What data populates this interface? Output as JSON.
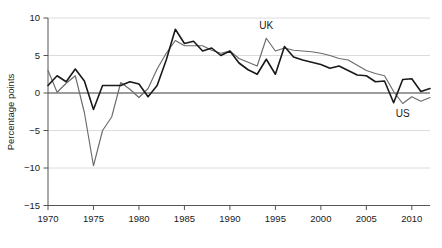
{
  "chart_data": {
    "type": "line",
    "title": "",
    "xlabel": "",
    "ylabel": "Percentage points",
    "xlim": [
      1970,
      2012
    ],
    "ylim": [
      -15,
      10
    ],
    "grid": true,
    "grid_axis": "y",
    "legend_position": "inline-annotations",
    "x_ticks": [
      1970,
      1975,
      1980,
      1985,
      1990,
      1995,
      2000,
      2005,
      2010
    ],
    "y_ticks": [
      -15,
      -10,
      -5,
      0,
      5,
      10
    ],
    "zero_line": 0,
    "annotations": [
      {
        "text": "UK",
        "x": 1994,
        "y": 8.6,
        "series": "UK"
      },
      {
        "text": "US",
        "x": 2009,
        "y": -3.2,
        "series": "US"
      }
    ],
    "x": [
      1970,
      1971,
      1972,
      1973,
      1974,
      1975,
      1976,
      1977,
      1978,
      1979,
      1980,
      1981,
      1982,
      1983,
      1984,
      1985,
      1986,
      1987,
      1988,
      1989,
      1990,
      1991,
      1992,
      1993,
      1994,
      1995,
      1996,
      1997,
      1998,
      1999,
      2000,
      2001,
      2002,
      2003,
      2004,
      2005,
      2006,
      2007,
      2008,
      2009,
      2010,
      2011,
      2012
    ],
    "series": [
      {
        "name": "US",
        "color": "#1a1a1a",
        "values": [
          1.0,
          2.3,
          1.5,
          3.2,
          1.6,
          -2.2,
          1.0,
          1.0,
          1.0,
          1.5,
          1.2,
          -0.5,
          1.0,
          4.4,
          8.5,
          6.6,
          6.9,
          5.6,
          6.0,
          5.0,
          5.6,
          4.0,
          3.1,
          2.5,
          4.5,
          2.5,
          6.2,
          4.8,
          4.4,
          4.1,
          3.8,
          3.3,
          3.6,
          3.0,
          2.4,
          2.3,
          1.5,
          1.6,
          -1.3,
          1.8,
          1.9,
          0.2,
          0.6
        ]
      },
      {
        "name": "UK",
        "color": "#6b6b6b",
        "values": [
          3.0,
          0.1,
          1.3,
          2.3,
          -2.6,
          -9.7,
          -5.0,
          -3.2,
          1.4,
          0.5,
          -0.6,
          0.6,
          3.2,
          5.3,
          7.0,
          6.3,
          6.3,
          6.3,
          5.7,
          5.3,
          5.6,
          4.6,
          4.1,
          3.6,
          7.3,
          5.6,
          6.0,
          5.7,
          5.6,
          5.5,
          5.3,
          5.0,
          4.6,
          4.4,
          3.7,
          3.0,
          2.6,
          2.3,
          0.2,
          -1.4,
          -0.5,
          -1.1,
          -0.6
        ]
      }
    ]
  },
  "axis": {
    "y_title": "Percentage points",
    "y_tick_labels": [
      "10",
      "5",
      "0",
      "−5",
      "−10",
      "−15"
    ],
    "x_tick_labels": [
      "1970",
      "1975",
      "1980",
      "1985",
      "1990",
      "1995",
      "2000",
      "2005",
      "2010"
    ]
  },
  "labels": {
    "uk": "UK",
    "us": "US"
  },
  "colors": {
    "us_line": "#1a1a1a",
    "uk_line": "#6b6b6b",
    "grid": "#d8d8d8",
    "axis": "#555555",
    "zero_line": "#4d4d4d",
    "background": "#ffffff"
  },
  "caption": {
    "partial_text": ""
  }
}
